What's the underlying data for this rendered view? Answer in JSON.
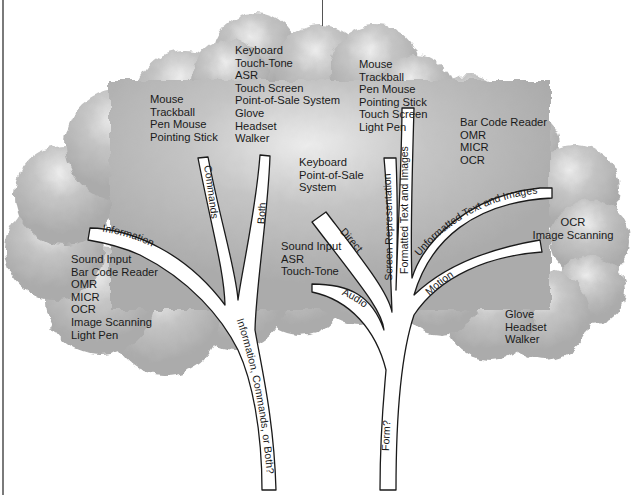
{
  "diagram": {
    "trunk_questions": {
      "left_trunk": "Information, Commands, or Both?",
      "right_trunk": "Form?"
    },
    "left_tree": {
      "branches": [
        {
          "label": "Information",
          "devices": [
            "Sound Input",
            "Bar Code Reader",
            "OMR",
            "MICR",
            "OCR",
            "Image Scanning",
            "Light Pen"
          ]
        },
        {
          "label": "Commands",
          "devices": [
            "Mouse",
            "Trackball",
            "Pen Mouse",
            "Pointing Stick"
          ]
        },
        {
          "label": "Both",
          "devices": [
            "Keyboard",
            "Touch-Tone",
            "ASR",
            "Touch Screen",
            "Point-of-Sale System",
            "Glove",
            "Headset",
            "Walker"
          ]
        }
      ]
    },
    "right_tree": {
      "branches": [
        {
          "label": "Audio",
          "devices": [
            "Sound Input",
            "ASR",
            "Touch-Tone"
          ]
        },
        {
          "label": "Direct",
          "devices": [
            "Keyboard",
            "Point-of-Sale",
            "System"
          ]
        },
        {
          "label": "Screen Representation",
          "devices": [
            "Mouse",
            "Trackball",
            "Pen Mouse",
            "Pointing Stick",
            "Touch Screen",
            "Light Pen"
          ]
        },
        {
          "label": "Formatted Text and Images",
          "devices": [
            "Bar Code Reader",
            "OMR",
            "MICR",
            "OCR"
          ]
        },
        {
          "label": "Unformatted Text and Images",
          "devices": [
            "OCR",
            "Image Scanning"
          ]
        },
        {
          "label": "Motion",
          "devices": [
            "Glove",
            "Headset",
            "Walker"
          ]
        }
      ]
    },
    "colors": {
      "canopy": "#b4b4b4",
      "canopy_highlight": "#e6e6e6",
      "branch_fill": "#ffffff",
      "branch_outline": "#1a1a1a",
      "text": "#1a1a1a",
      "background": "#ffffff"
    }
  }
}
